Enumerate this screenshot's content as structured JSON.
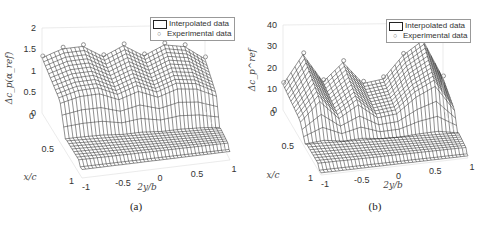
{
  "chart_data": [
    {
      "type": "surface",
      "panel": "a",
      "caption": "(a)",
      "title": "",
      "zlabel": "Δc_p(α_ref)",
      "xlabel": "2y/b",
      "ylabel": "x/c",
      "zlim": [
        0,
        2
      ],
      "xlim": [
        -1,
        1
      ],
      "ylim": [
        0,
        1
      ],
      "zticks": [
        "0",
        "0.5",
        "1",
        "1.5",
        "2"
      ],
      "xticks": [
        "-1",
        "-0.5",
        "0",
        "0.5",
        "1"
      ],
      "yticks": [
        "0",
        "0.5",
        "1"
      ],
      "legend": {
        "position": "top-right",
        "entries": [
          {
            "label": "Interpolated data",
            "marker": "surface"
          },
          {
            "label": "Experimental data",
            "marker": "circle"
          }
        ]
      },
      "surface_profile": {
        "description": "Plateau near 1.5 at leading edge (x/c≈0) across span, dropping to ~0.2 at trailing edge; dip near 2y/b≈-0.3 and 0.3",
        "span": [
          -1,
          -0.75,
          -0.5,
          -0.25,
          0,
          0.25,
          0.5,
          0.75,
          1
        ],
        "le_values": [
          1.3,
          1.5,
          1.55,
          1.3,
          1.55,
          1.3,
          1.55,
          1.5,
          1.2
        ],
        "te_values": [
          0.2,
          0.2,
          0.2,
          0.2,
          0.2,
          0.2,
          0.2,
          0.2,
          0.2
        ]
      }
    },
    {
      "type": "surface",
      "panel": "b",
      "caption": "(b)",
      "title": "",
      "zlabel": "Δc_p^ref",
      "xlabel": "2y/b",
      "ylabel": "x/c",
      "zlim": [
        0,
        40
      ],
      "xlim": [
        -1,
        1
      ],
      "ylim": [
        0,
        1
      ],
      "zticks": [
        "0",
        "10",
        "20",
        "30",
        "40"
      ],
      "xticks": [
        "-1",
        "-0.5",
        "0",
        "0.5",
        "1"
      ],
      "yticks": [
        "0",
        "0.5",
        "1"
      ],
      "legend": {
        "position": "top-right",
        "entries": [
          {
            "label": "Interpolated data",
            "marker": "surface"
          },
          {
            "label": "Experimental data",
            "marker": "circle"
          }
        ]
      },
      "surface_profile": {
        "description": "Spiky leading-edge peaks (~25-32) at several spanwise stations, plateau ~12 in mid-span, low near trailing edge",
        "span": [
          -1,
          -0.75,
          -0.5,
          -0.25,
          0,
          0.25,
          0.5,
          0.75,
          1
        ],
        "le_values": [
          12,
          26,
          13,
          22,
          12,
          14,
          25,
          32,
          14
        ],
        "te_values": [
          1,
          1,
          1,
          1,
          1,
          1,
          1,
          1,
          1
        ]
      }
    }
  ]
}
